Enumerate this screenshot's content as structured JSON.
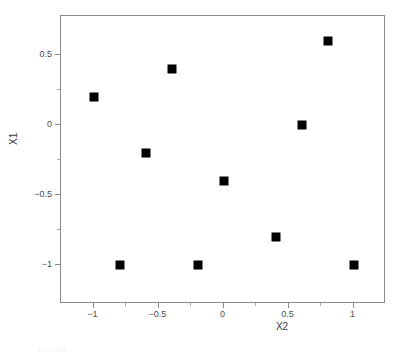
{
  "chart_data": {
    "type": "scatter",
    "title": "",
    "xlabel": "X2",
    "ylabel": "X1",
    "xlim": [
      -1.25,
      1.25
    ],
    "ylim": [
      -1.28,
      0.78
    ],
    "grid": false,
    "legend": null,
    "marker": {
      "shape": "square",
      "color": "#000000",
      "size_px": 9
    },
    "x_ticks": [
      {
        "value": -1,
        "label": "−1"
      },
      {
        "value": -0.5,
        "label": "−0.5"
      },
      {
        "value": 0,
        "label": "0"
      },
      {
        "value": 0.5,
        "label": "0.5"
      },
      {
        "value": 1,
        "label": "1"
      }
    ],
    "x_minor_ticks": [
      -0.75,
      -0.25,
      0.25,
      0.75
    ],
    "y_ticks": [
      {
        "value": 0.5,
        "label": "0.5"
      },
      {
        "value": 0,
        "label": "0"
      },
      {
        "value": -0.5,
        "label": "−0.5"
      },
      {
        "value": -1,
        "label": "−1"
      }
    ],
    "y_minor_ticks": [
      0.25,
      -0.25,
      -0.75
    ],
    "points": [
      {
        "x": -1.0,
        "y": 0.2
      },
      {
        "x": -0.8,
        "y": -1.0
      },
      {
        "x": -0.6,
        "y": -0.2
      },
      {
        "x": -0.4,
        "y": 0.4
      },
      {
        "x": -0.2,
        "y": -1.0
      },
      {
        "x": 0.0,
        "y": -0.4
      },
      {
        "x": 0.4,
        "y": -0.8
      },
      {
        "x": 0.6,
        "y": 0.0
      },
      {
        "x": 0.8,
        "y": 0.6
      },
      {
        "x": 1.0,
        "y": -1.0
      }
    ]
  },
  "axis": {
    "x_title": "X2",
    "y_title": "X1"
  },
  "caption": {
    "text": "FIGURE"
  },
  "colors": {
    "frame": "#8a8a8a",
    "marker": "#000000",
    "tick_label": "#4a4a4a",
    "axis_label": "#3a3a3a",
    "background": "#ffffff"
  }
}
